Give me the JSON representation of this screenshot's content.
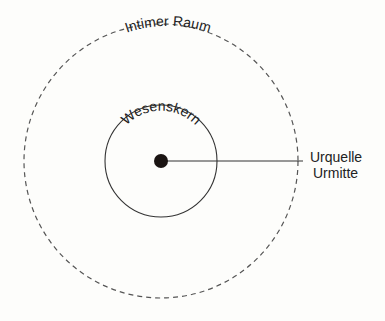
{
  "diagram": {
    "outer_circle": {
      "label": "Intimer Raum",
      "cx": 161,
      "cy": 161,
      "r": 137,
      "style": "dashed"
    },
    "inner_circle": {
      "label": "Wesenskern",
      "cx": 161,
      "cy": 161,
      "r": 56,
      "style": "solid"
    },
    "center_dot": {
      "cx": 161,
      "cy": 161,
      "r": 7
    },
    "pointer": {
      "x1": 161,
      "y1": 161,
      "x2": 303,
      "y2": 161
    },
    "callout": {
      "line1": "Urquelle",
      "line2": "Urmitte"
    },
    "colors": {
      "ink": "#222222",
      "dash": "#555555",
      "background": "#fdfdfb"
    }
  }
}
